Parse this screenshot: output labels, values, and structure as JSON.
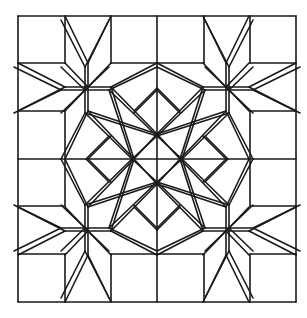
{
  "diagram": {
    "title": "",
    "stroke_color": "#1a1a1a",
    "background": "#ffffff",
    "grid": {
      "x": [
        18,
        65,
        111,
        157,
        204,
        250,
        296
      ],
      "y": [
        16,
        63,
        111,
        159,
        206,
        254,
        302
      ]
    },
    "center": [
      157,
      159
    ],
    "quadrant_segments_top_left": [
      [
        65,
        16,
        88,
        63
      ],
      [
        111,
        16,
        88,
        63
      ],
      [
        88,
        63,
        88,
        87
      ],
      [
        18,
        63,
        65,
        87
      ],
      [
        18,
        111,
        65,
        87
      ],
      [
        65,
        87,
        88,
        87
      ],
      [
        88,
        87,
        65,
        63
      ],
      [
        88,
        87,
        111,
        63
      ],
      [
        88,
        87,
        65,
        111
      ],
      [
        88,
        87,
        111,
        87
      ],
      [
        111,
        87,
        157,
        63
      ],
      [
        88,
        87,
        88,
        111
      ],
      [
        88,
        111,
        65,
        159
      ],
      [
        111,
        87,
        157,
        134
      ],
      [
        111,
        87,
        134,
        159
      ],
      [
        88,
        111,
        134,
        159
      ],
      [
        88,
        111,
        157,
        134
      ],
      [
        157,
        88,
        134,
        111
      ],
      [
        88,
        159,
        111,
        136
      ],
      [
        157,
        134,
        134,
        159
      ]
    ],
    "outer_lines": [
      [
        18,
        16,
        296,
        16
      ],
      [
        18,
        302,
        296,
        302
      ],
      [
        18,
        16,
        18,
        302
      ],
      [
        296,
        16,
        296,
        302
      ],
      [
        65,
        16,
        65,
        63
      ],
      [
        111,
        16,
        111,
        63
      ],
      [
        157,
        16,
        157,
        302
      ],
      [
        204,
        16,
        204,
        63
      ],
      [
        250,
        16,
        250,
        63
      ],
      [
        65,
        254,
        65,
        302
      ],
      [
        111,
        254,
        111,
        302
      ],
      [
        204,
        254,
        204,
        302
      ],
      [
        250,
        254,
        250,
        302
      ],
      [
        18,
        63,
        65,
        63
      ],
      [
        111,
        63,
        204,
        63
      ],
      [
        250,
        63,
        296,
        63
      ],
      [
        18,
        254,
        65,
        254
      ],
      [
        111,
        254,
        204,
        254
      ],
      [
        250,
        254,
        296,
        254
      ],
      [
        18,
        159,
        296,
        159
      ],
      [
        18,
        111,
        65,
        111
      ],
      [
        250,
        111,
        296,
        111
      ],
      [
        18,
        206,
        65,
        206
      ],
      [
        250,
        206,
        296,
        206
      ],
      [
        65,
        111,
        65,
        206
      ],
      [
        250,
        111,
        250,
        206
      ]
    ]
  }
}
